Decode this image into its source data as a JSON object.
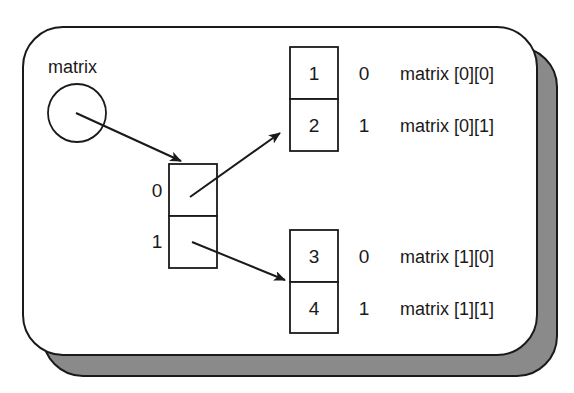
{
  "diagram": {
    "title": "matrix",
    "colors": {
      "background": "#ffffff",
      "card": "#ffffff",
      "shadow": "#8a8a8a",
      "stroke": "#1a1a1a"
    },
    "pointer_variable": {
      "name": "matrix",
      "shape": "circle"
    },
    "row_array": {
      "indices": [
        "0",
        "1"
      ]
    },
    "rows": [
      {
        "row_index": "0",
        "cells": [
          {
            "value": "1",
            "index": "0",
            "label": "matrix [0][0]"
          },
          {
            "value": "2",
            "index": "1",
            "label": "matrix [0][1]"
          }
        ]
      },
      {
        "row_index": "1",
        "cells": [
          {
            "value": "3",
            "index": "0",
            "label": "matrix [1][0]"
          },
          {
            "value": "4",
            "index": "1",
            "label": "matrix [1][1]"
          }
        ]
      }
    ],
    "arrows": [
      {
        "from": "matrix",
        "to": "row_array"
      },
      {
        "from": "row_array[0]",
        "to": "rows[0]"
      },
      {
        "from": "row_array[1]",
        "to": "rows[1]"
      }
    ]
  }
}
